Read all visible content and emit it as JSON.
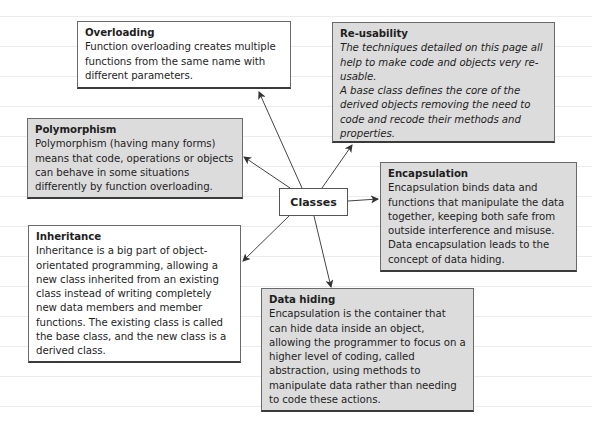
{
  "diagram": {
    "center": {
      "label": "Classes"
    },
    "nodes": [
      {
        "id": "overloading",
        "title": "Overloading",
        "body": "Function overloading creates multiple functions from the same name with different parameters.",
        "fill": "white"
      },
      {
        "id": "reusability",
        "title": "Re-usability",
        "body": "The techniques detailed on this page all help to make code and objects very re-usable.\nA base class defines the core of the derived objects removing the need to code and recode their methods and properties.",
        "fill": "grey"
      },
      {
        "id": "polymorphism",
        "title": "Polymorphism",
        "body": "Polymorphism (having many forms) means that code, operations or objects can behave in some situations differently by function overloading.",
        "fill": "grey"
      },
      {
        "id": "encapsulation",
        "title": "Encapsulation",
        "body": "Encapsulation binds data and functions that manipulate the data together, keeping both safe from outside interference and misuse. Data encapsulation leads to the concept of data hiding.",
        "fill": "grey"
      },
      {
        "id": "inheritance",
        "title": "Inheritance",
        "body": "Inheritance is a big part of object-orientated programming, allowing a new class inherited from an existing class instead of writing completely new data members and member functions. The existing class is called the base class, and the new class is a derived class.",
        "fill": "white"
      },
      {
        "id": "data_hiding",
        "title": "Data hiding",
        "body": "Encapsulation is the container that can hide data inside an object, allowing the programmer to focus on a higher level of coding, called abstraction, using methods to manipulate data rather than needing to code these actions.",
        "fill": "grey"
      }
    ],
    "edges": [
      {
        "from": "Classes",
        "to": "Overloading"
      },
      {
        "from": "Classes",
        "to": "Re-usability"
      },
      {
        "from": "Classes",
        "to": "Polymorphism"
      },
      {
        "from": "Classes",
        "to": "Encapsulation"
      },
      {
        "from": "Classes",
        "to": "Inheritance"
      },
      {
        "from": "Classes",
        "to": "Data hiding"
      }
    ],
    "colors": {
      "grey_fill": "#dcdcdc",
      "white_fill": "#ffffff",
      "border": "#555555",
      "arrow": "#444444"
    }
  }
}
